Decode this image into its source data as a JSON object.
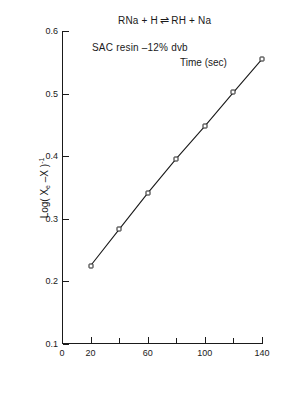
{
  "figure": {
    "equation": {
      "left": "RNa + H",
      "arrow": "⇌",
      "right": "RH + Na"
    },
    "subtitle": "SAC resin –12% dvb"
  },
  "chart_data": {
    "type": "line",
    "subtitle": "SAC resin –12% dvb",
    "xlabel": "Time (sec)",
    "ylabel": "Log( Xₑ –X )⁻¹",
    "xlim": [
      0,
      140
    ],
    "ylim": [
      0.1,
      0.6
    ],
    "grid": false,
    "legend": null,
    "x_ticks": [
      0,
      20,
      40,
      60,
      80,
      100,
      120,
      140
    ],
    "x_tick_labels": [
      "0",
      "20",
      "",
      "60",
      "",
      "100",
      "",
      "140"
    ],
    "y_ticks": [
      0.1,
      0.2,
      0.3,
      0.4,
      0.5,
      0.6
    ],
    "y_tick_labels": [
      "0.1",
      "0.2",
      "0.3",
      "0.4",
      "0.5",
      "0.6"
    ],
    "marker": "open-square",
    "x": [
      20,
      40,
      60,
      80,
      100,
      120,
      140
    ],
    "values": [
      0.225,
      0.283,
      0.341,
      0.396,
      0.448,
      0.502,
      0.555
    ]
  }
}
